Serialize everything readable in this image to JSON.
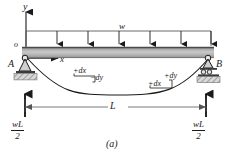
{
  "figure": {
    "caption": "(a)",
    "axes": {
      "y_label": "y",
      "x_label": "x",
      "origin_label": "o"
    },
    "supports": {
      "left_label": "A",
      "left_type": "pin-support",
      "right_label": "B",
      "right_type": "roller-support"
    },
    "load": {
      "label": "w",
      "type": "uniformly-distributed-load",
      "arrow_count": 6
    },
    "reactions": {
      "left": {
        "numerator": "wL",
        "denominator": "2"
      },
      "right": {
        "numerator": "wL",
        "denominator": "2"
      }
    },
    "dimension": {
      "span_label": "L"
    },
    "annotations": {
      "left_dx": "+dx",
      "left_dy": "−dy",
      "right_dy": "+dy",
      "right_dx": "+dx"
    },
    "colors": {
      "beam_fill": "#b4b4b4",
      "beam_edge": "#4d4d4d",
      "line": "#1a1a1a",
      "hatch": "#808080",
      "background": "#ffffff"
    }
  }
}
